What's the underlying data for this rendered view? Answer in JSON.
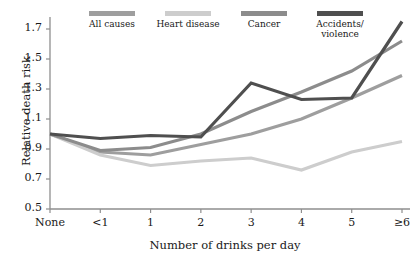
{
  "chart_data": {
    "type": "line",
    "title": "",
    "xlabel": "Number of drinks per day",
    "ylabel": "Relative death risk",
    "categories": [
      "None",
      "<1",
      "1",
      "2",
      "3",
      "4",
      "5",
      "≥6"
    ],
    "xtick_labels": [
      "None",
      "<1",
      "1",
      "2",
      "3",
      "4",
      "5",
      "≥6"
    ],
    "ytick_labels": [
      "0.5",
      "0.7",
      "0.9",
      "1.1",
      "1.3",
      "1.5",
      "1.7"
    ],
    "ytick_values": [
      0.5,
      0.7,
      0.9,
      1.1,
      1.3,
      1.5,
      1.7
    ],
    "ylim": [
      0.5,
      1.79
    ],
    "xlim": [
      0,
      7
    ],
    "grid": false,
    "legend_position": "top",
    "series": [
      {
        "name": "All causes",
        "color": "#9e9e9e",
        "values": [
          1.0,
          0.88,
          0.86,
          0.93,
          1.0,
          1.1,
          1.24,
          1.39
        ]
      },
      {
        "name": "Heart disease",
        "color": "#cdcdcd",
        "values": [
          1.0,
          0.86,
          0.79,
          0.82,
          0.84,
          0.76,
          0.88,
          0.95
        ]
      },
      {
        "name": "Cancer",
        "color": "#8c8c8c",
        "values": [
          1.0,
          0.89,
          0.91,
          1.0,
          1.15,
          1.28,
          1.42,
          1.62
        ]
      },
      {
        "name": "Accidents/\nviolence",
        "color": "#4f4f4f",
        "values": [
          1.0,
          0.97,
          0.99,
          0.98,
          1.34,
          1.23,
          1.24,
          1.75
        ]
      }
    ]
  },
  "legend": {
    "entries": [
      {
        "label": "All causes",
        "color": "#9e9e9e"
      },
      {
        "label": "Heart disease",
        "color": "#cdcdcd"
      },
      {
        "label": "Cancer",
        "color": "#8c8c8c"
      },
      {
        "label": "Accidents/\nviolence",
        "color": "#4f4f4f"
      }
    ]
  },
  "axes": {
    "y_title": "Relative death risk",
    "x_title": "Number of drinks per day",
    "y_ticks": [
      "1.7",
      "1.5",
      "1.3",
      "1.1",
      "0.9",
      "0.7",
      "0.5"
    ],
    "x_ticks": [
      "None",
      "<1",
      "1",
      "2",
      "3",
      "4",
      "5",
      "≥6"
    ],
    "axis_color": "#8e8e8e"
  }
}
